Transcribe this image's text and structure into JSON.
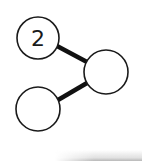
{
  "diagram": {
    "nodes": [
      {
        "id": "node-1",
        "label": "2",
        "cx": 38,
        "cy": 38,
        "r": 21
      },
      {
        "id": "node-2",
        "label": "",
        "cx": 106,
        "cy": 72,
        "r": 22
      },
      {
        "id": "node-3",
        "label": "",
        "cx": 38,
        "cy": 109,
        "r": 22
      }
    ],
    "edges": [
      {
        "from": "node-1",
        "to": "node-2"
      },
      {
        "from": "node-3",
        "to": "node-2"
      }
    ],
    "colors": {
      "stroke": "#1a1a1a",
      "fill": "#ffffff"
    }
  }
}
